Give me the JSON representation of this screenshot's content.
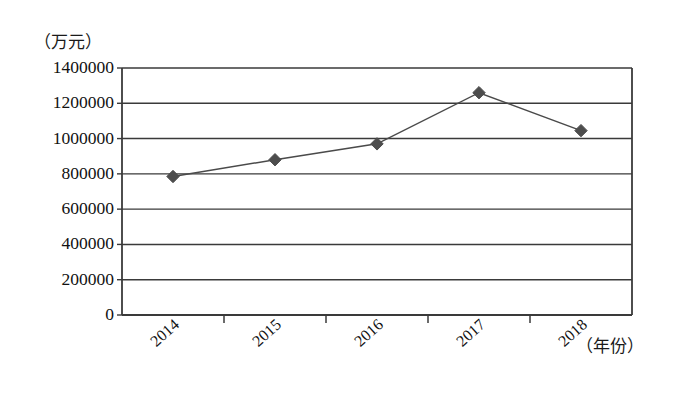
{
  "chart_data": {
    "type": "line",
    "title": "",
    "subtitle": "",
    "xlabel": "（年份）",
    "ylabel": "（万元）",
    "categories": [
      "2014",
      "2015",
      "2016",
      "2017",
      "2018"
    ],
    "values": [
      785000,
      880000,
      970000,
      1260000,
      1045000
    ],
    "series": [
      {
        "name": "",
        "values": [
          785000,
          880000,
          970000,
          1260000,
          1045000
        ]
      }
    ],
    "ylim": [
      0,
      1400000
    ],
    "y_ticks": [
      0,
      200000,
      400000,
      600000,
      800000,
      1000000,
      1200000,
      1400000
    ],
    "y_tick_labels": [
      "0",
      "200000",
      "400000",
      "600000",
      "800000",
      "1000000",
      "1200000",
      "1400000"
    ],
    "grid": "horizontal",
    "legend": "none",
    "marker": "diamond",
    "line_color": "#4a4a4a",
    "marker_color": "#4d4d4d",
    "axis_color": "#3a3a3a",
    "background": "#ffffff"
  },
  "axes": {
    "y_unit_label": "（万元）",
    "x_unit_label": "（年份）"
  }
}
